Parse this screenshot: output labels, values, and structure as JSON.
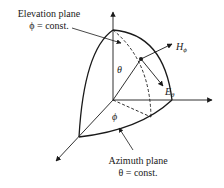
{
  "diagram": {
    "type": "spherical coordinate field components",
    "labels": {
      "elevation_title": "Elevation plane",
      "elevation_eq": "ϕ = const.",
      "azimuth_title": "Azimuth plane",
      "azimuth_eq": "θ = const.",
      "theta": "θ",
      "phi": "ϕ",
      "h_main": "H",
      "h_sub": "ϕ",
      "e_main": "E",
      "e_sub": "θ"
    },
    "colors": {
      "stroke": "#1a1a1a",
      "background": "#ffffff"
    }
  }
}
